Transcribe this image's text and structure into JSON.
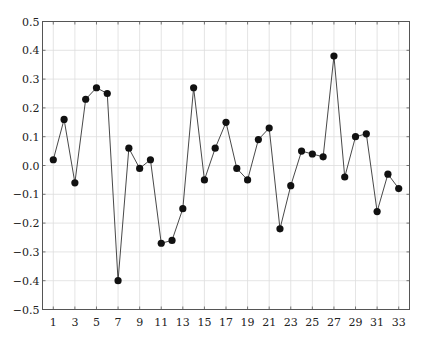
{
  "chart_data": {
    "type": "line",
    "title": "",
    "xlabel": "",
    "ylabel": "",
    "x": [
      1,
      2,
      3,
      4,
      5,
      6,
      7,
      8,
      9,
      10,
      11,
      12,
      13,
      14,
      15,
      16,
      17,
      18,
      19,
      20,
      21,
      22,
      23,
      24,
      25,
      26,
      27,
      28,
      29,
      30,
      31,
      32,
      33
    ],
    "series": [
      {
        "name": "",
        "values": [
          0.02,
          0.16,
          -0.06,
          0.23,
          0.27,
          0.25,
          -0.4,
          0.06,
          -0.01,
          0.02,
          -0.27,
          -0.26,
          -0.15,
          0.27,
          -0.05,
          0.06,
          0.15,
          -0.01,
          -0.05,
          0.09,
          0.13,
          -0.22,
          -0.07,
          0.05,
          0.04,
          0.03,
          0.38,
          -0.04,
          0.1,
          0.11,
          -0.16,
          -0.03,
          -0.08
        ],
        "marker": "filled-circle",
        "color": "#111111"
      }
    ],
    "xlim": [
      0,
      34
    ],
    "ylim": [
      -0.5,
      0.5
    ],
    "xticks": [
      1,
      3,
      5,
      7,
      9,
      11,
      13,
      15,
      17,
      19,
      21,
      23,
      25,
      27,
      29,
      31,
      33
    ],
    "xtick_labels": [
      "1",
      "3",
      "5",
      "7",
      "9",
      "11",
      "13",
      "15",
      "17",
      "19",
      "21",
      "23",
      "25",
      "27",
      "29",
      "31",
      "33"
    ],
    "yticks": [
      -0.5,
      -0.4,
      -0.3,
      -0.2,
      -0.1,
      0.0,
      0.1,
      0.2,
      0.3,
      0.4,
      0.5
    ],
    "ytick_labels": [
      "−0.5",
      "−0.4",
      "−0.3",
      "−0.2",
      "−0.1",
      "0.0",
      "0.1",
      "0.2",
      "0.3",
      "0.4",
      "0.5"
    ],
    "grid": true,
    "legend": null
  },
  "style": {
    "axis_color": "#555555",
    "grid_color": "#dddddd",
    "line_color": "#333333",
    "marker_color": "#111111"
  }
}
